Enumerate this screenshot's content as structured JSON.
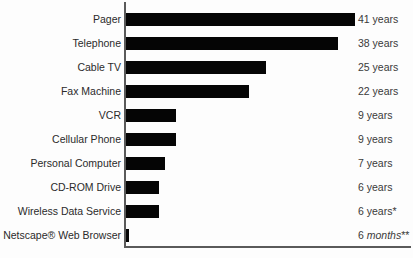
{
  "chart_data": {
    "type": "bar",
    "orientation": "horizontal",
    "title": "",
    "subtitle": "",
    "xlabel": "",
    "ylabel": "",
    "grid": false,
    "legend": null,
    "axis": {
      "value_axis_visible_line": true,
      "category_axis_visible_line": true,
      "tick_labels": [],
      "xlim": [
        0,
        41
      ]
    },
    "unit": "years",
    "categories": [
      "Pager",
      "Telephone",
      "Cable TV",
      "Fax Machine",
      "VCR",
      "Cellular Phone",
      "Personal Computer",
      "CD-ROM Drive",
      "Wireless Data Service",
      "Netscape® Web Browser"
    ],
    "values": [
      41,
      38,
      25,
      22,
      9,
      9,
      7,
      6,
      6,
      0.5
    ],
    "value_labels": [
      "41 years",
      "38 years",
      "25 years",
      "22 years",
      "9 years",
      "9 years",
      "7 years",
      "6 years",
      "6 years*",
      "6 months**"
    ],
    "annotations": [
      "* footnote marker on Wireless Data Service",
      "** footnote marker on Netscape® Web Browser"
    ],
    "rows": [
      {
        "category": "Pager",
        "value": 41,
        "value_number": "41",
        "value_unit": " years",
        "value_unit_italic": false,
        "footnote": ""
      },
      {
        "category": "Telephone",
        "value": 38,
        "value_number": "38",
        "value_unit": " years",
        "value_unit_italic": false,
        "footnote": ""
      },
      {
        "category": "Cable TV",
        "value": 25,
        "value_number": "25",
        "value_unit": " years",
        "value_unit_italic": false,
        "footnote": ""
      },
      {
        "category": "Fax Machine",
        "value": 22,
        "value_number": "22",
        "value_unit": " years",
        "value_unit_italic": false,
        "footnote": ""
      },
      {
        "category": "VCR",
        "value": 9,
        "value_number": "9",
        "value_unit": " years",
        "value_unit_italic": false,
        "footnote": ""
      },
      {
        "category": "Cellular Phone",
        "value": 9,
        "value_number": "9",
        "value_unit": " years",
        "value_unit_italic": false,
        "footnote": ""
      },
      {
        "category": "Personal Computer",
        "value": 7,
        "value_number": "7",
        "value_unit": " years",
        "value_unit_italic": false,
        "footnote": ""
      },
      {
        "category": "CD-ROM Drive",
        "value": 6,
        "value_number": "6",
        "value_unit": " years",
        "value_unit_italic": false,
        "footnote": ""
      },
      {
        "category": "Wireless Data Service",
        "value": 6,
        "value_number": "6",
        "value_unit": " years",
        "value_unit_italic": false,
        "footnote": "*"
      },
      {
        "category": "Netscape® Web Browser",
        "value": 0.5,
        "value_number": "6",
        "value_unit": " months",
        "value_unit_italic": true,
        "footnote": "**"
      }
    ],
    "colors": {
      "bar": "#050505",
      "axis": "#5a5a5a",
      "category_text": "#2b2b2b",
      "value_text": "#3a3a3a",
      "background": "#fdfdfd"
    },
    "layout": {
      "bar_origin_x_px": 126,
      "px_per_year": 5.58,
      "bar_height_px": 13,
      "row_pitch_px": 24,
      "first_row_top_px": 13,
      "value_label_x_px": 358
    }
  }
}
